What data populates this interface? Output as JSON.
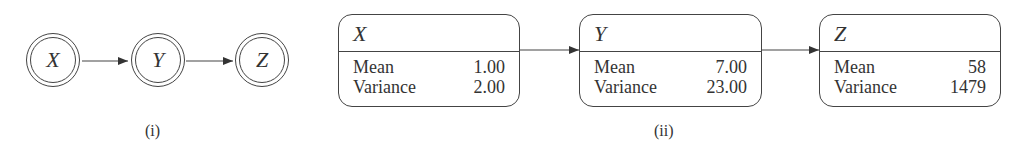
{
  "diagram_i": {
    "caption": "(i)",
    "nodes": [
      {
        "label": "X"
      },
      {
        "label": "Y"
      },
      {
        "label": "Z"
      }
    ],
    "edges": [
      [
        "X",
        "Y"
      ],
      [
        "Y",
        "Z"
      ]
    ]
  },
  "diagram_ii": {
    "caption": "(ii)",
    "nodes": [
      {
        "label": "X",
        "rows": [
          {
            "name": "Mean",
            "value": "1.00"
          },
          {
            "name": "Variance",
            "value": "2.00"
          }
        ]
      },
      {
        "label": "Y",
        "rows": [
          {
            "name": "Mean",
            "value": "7.00"
          },
          {
            "name": "Variance",
            "value": "23.00"
          }
        ]
      },
      {
        "label": "Z",
        "rows": [
          {
            "name": "Mean",
            "value": "58"
          },
          {
            "name": "Variance",
            "value": "1479"
          }
        ]
      }
    ],
    "edges": [
      [
        "X",
        "Y"
      ],
      [
        "Y",
        "Z"
      ]
    ]
  }
}
